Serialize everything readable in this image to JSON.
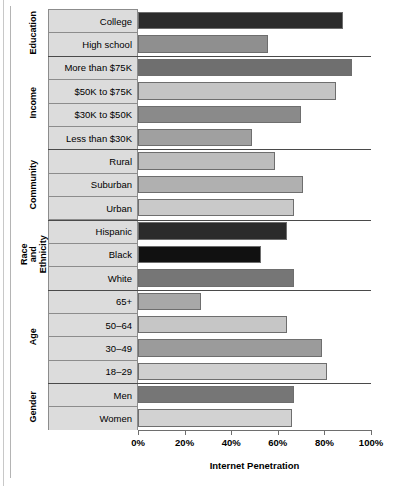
{
  "chart_data": {
    "type": "bar",
    "orientation": "horizontal",
    "title": "",
    "xlabel": "Internet Penetration",
    "ylabel": "",
    "xlim": [
      0,
      100
    ],
    "xticks": [
      "0%",
      "20%",
      "40%",
      "60%",
      "80%",
      "100%"
    ],
    "xtick_values": [
      0,
      20,
      40,
      60,
      80,
      100
    ],
    "grid": false,
    "legend": false,
    "categories": [
      "College",
      "High school",
      "More than $75K",
      "$50K to $75K",
      "$30K to $50K",
      "Less than $30K",
      "Rural",
      "Suburban",
      "Urban",
      "Hispanic",
      "Black",
      "White",
      "65+",
      "50–64",
      "30–49",
      "18–29",
      "Men",
      "Women"
    ],
    "values": [
      88,
      56,
      92,
      85,
      70,
      49,
      59,
      71,
      67,
      64,
      53,
      67,
      27,
      64,
      79,
      81,
      67,
      66
    ],
    "bar_colors": [
      "#2b2b2b",
      "#8f8f8f",
      "#6f6f6f",
      "#c4c4c4",
      "#8a8a8a",
      "#a0a0a0",
      "#bdbdbd",
      "#b0b0b0",
      "#c9c9c9",
      "#2b2b2b",
      "#111111",
      "#767676",
      "#a8a8a8",
      "#c6c6c6",
      "#9b9b9b",
      "#cfcfcf",
      "#767676",
      "#d2d2d2"
    ],
    "groups": [
      {
        "label": "Education",
        "count": 2
      },
      {
        "label": "Income",
        "count": 4
      },
      {
        "label": "Community",
        "count": 3
      },
      {
        "label": "Race and Ethnicity",
        "count": 3
      },
      {
        "label": "Age",
        "count": 4
      },
      {
        "label": "Gender",
        "count": 2
      }
    ]
  },
  "axis": {
    "x_label": "Internet Penetration",
    "ticks": [
      "0%",
      "20%",
      "40%",
      "60%",
      "80%",
      "100%"
    ]
  }
}
